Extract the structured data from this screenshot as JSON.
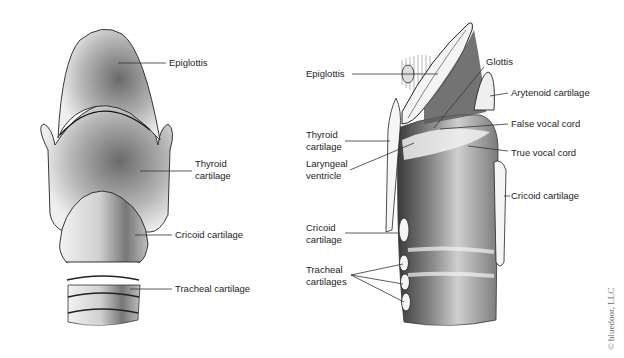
{
  "figure": {
    "left_view": {
      "name": "Larynx anterior view",
      "labels": [
        {
          "id": "epiglottis",
          "text": "Epiglottis"
        },
        {
          "id": "thyroid-cartilage",
          "line1": "Thyroid",
          "line2": "cartilage"
        },
        {
          "id": "cricoid-cartilage",
          "text": "Cricoid cartilage"
        },
        {
          "id": "tracheal-cartilage",
          "text": "Tracheal cartilage"
        }
      ]
    },
    "right_view": {
      "name": "Larynx sagittal section",
      "labels": [
        {
          "id": "epiglottis",
          "text": "Epiglottis"
        },
        {
          "id": "glottis",
          "text": "Glottis"
        },
        {
          "id": "arytenoid-cartilage",
          "text": "Arytenoid cartilage"
        },
        {
          "id": "false-vocal-cord",
          "text": "False vocal cord"
        },
        {
          "id": "thyroid-cartilage",
          "line1": "Thyroid",
          "line2": "cartilage"
        },
        {
          "id": "true-vocal-cord",
          "text": "True vocal cord"
        },
        {
          "id": "laryngeal-ventricle",
          "line1": "Laryngeal",
          "line2": "ventricle"
        },
        {
          "id": "cricoid-cartilage-right",
          "text": "Cricoid cartilage"
        },
        {
          "id": "cricoid-cartilage-left",
          "line1": "Cricoid",
          "line2": "cartilage"
        },
        {
          "id": "tracheal-cartilages",
          "line1": "Tracheal",
          "line2": "cartilages"
        }
      ]
    },
    "copyright": "© bluedoor, LLC"
  }
}
